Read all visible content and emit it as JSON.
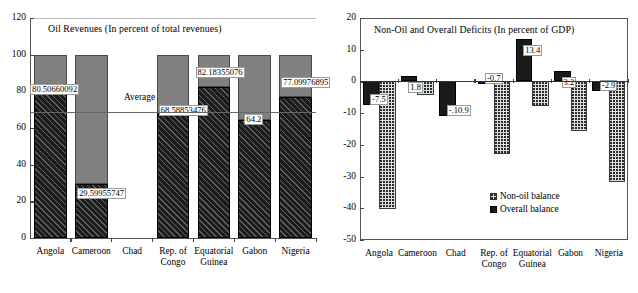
{
  "chart_data": [
    {
      "id": "oil-revenues",
      "type": "bar",
      "title": "Oil Revenues (In percent of total revenues)",
      "xlabel": "",
      "ylabel": "",
      "ylim": [
        0,
        120
      ],
      "yticks": [
        0,
        20,
        40,
        60,
        80,
        100,
        120
      ],
      "ytick_labels": [
        "0",
        "20",
        "40",
        "60",
        "80",
        "100",
        "120"
      ],
      "grid": false,
      "stacked": true,
      "categories": [
        "Angola",
        "Cameroon",
        "Chad",
        "Rep. of\nCongo",
        "Equatorial\nGuinea",
        "Gabon",
        "Nigeria"
      ],
      "category_lines": [
        [
          "Angola"
        ],
        [
          "Cameroon"
        ],
        [
          "Chad"
        ],
        [
          "Rep. of",
          "Congo"
        ],
        [
          "Equatorial",
          "Guinea"
        ],
        [
          "Gabon"
        ],
        [
          "Nigeria"
        ]
      ],
      "series": [
        {
          "name": "Oil revenues",
          "pattern": "black-hatched",
          "values": [
            80.50660092,
            29.59955747,
            null,
            68.58853476,
            82.18355076,
            64.2,
            77.09976895
          ],
          "labels": [
            "80.50660092",
            "29.59955747",
            "",
            "68.58853476",
            "82.18355076",
            "64.2",
            "77.09976895"
          ]
        },
        {
          "name": "Remainder to 100",
          "pattern": "gray",
          "values": [
            19.49339908,
            70.40044253,
            null,
            31.41146524,
            17.81644924,
            35.8,
            22.90023105
          ],
          "labels": [
            "",
            "",
            "",
            "",
            "",
            "",
            ""
          ]
        }
      ],
      "annotations": [
        {
          "name": "average-line",
          "label": "Average",
          "value": 68.6
        }
      ]
    },
    {
      "id": "non-oil-overall-deficits",
      "type": "bar",
      "title": "Non-Oil and Overall Deficits (In percent of GDP)",
      "xlabel": "",
      "ylabel": "",
      "ylim": [
        -50,
        20
      ],
      "yticks": [
        20,
        10,
        0,
        -10,
        -20,
        -30,
        -40,
        -50
      ],
      "ytick_labels": [
        "20",
        "10",
        "0",
        "-10",
        "-20",
        "-30",
        "-40",
        "-50"
      ],
      "grid": false,
      "categories": [
        "Angola",
        "Cameroon",
        "Chad",
        "Rep. of\nCongo",
        "Equatorial\nGuinea",
        "Gabon",
        "Nigeria"
      ],
      "category_lines": [
        [
          "Angola"
        ],
        [
          "Cameroon"
        ],
        [
          "Chad"
        ],
        [
          "Rep. of",
          "Congo"
        ],
        [
          "Equatorial",
          "Guinea"
        ],
        [
          "Gabon"
        ],
        [
          "Nigeria"
        ]
      ],
      "legend_position": "inside-bottom-right",
      "series": [
        {
          "name": "Overall balance",
          "pattern": "solid-black",
          "values": [
            -7.5,
            1.8,
            -10.9,
            -0.7,
            13.4,
            3.2,
            -2.9
          ],
          "labels": [
            "-7.5",
            "1.8",
            "-.10.9",
            "-0.7",
            "13.4",
            "3.2",
            "-2.9"
          ]
        },
        {
          "name": "Non-oil balance",
          "pattern": "dotted",
          "values": [
            -40.2,
            -4.3,
            0,
            -22.8,
            -7.6,
            -15.7,
            -31.8
          ],
          "labels": [
            "",
            "",
            "",
            "",
            "",
            "",
            ""
          ]
        }
      ]
    }
  ],
  "left_chart": {
    "title": "Oil Revenues (In percent of total revenues)",
    "yticks": [
      "120",
      "100",
      "80",
      "60",
      "40",
      "20",
      "0"
    ],
    "average_label": "Average",
    "bar_labels": [
      "80.50660092",
      "29.59955747",
      "68.58853476",
      "82.18355076",
      "64.2",
      "77.09976895"
    ],
    "categories": [
      {
        "l1": "Angola",
        "l2": ""
      },
      {
        "l1": "Cameroon",
        "l2": ""
      },
      {
        "l1": "Chad",
        "l2": ""
      },
      {
        "l1": "Rep. of",
        "l2": "Congo"
      },
      {
        "l1": "Equatorial",
        "l2": "Guinea"
      },
      {
        "l1": "Gabon",
        "l2": ""
      },
      {
        "l1": "Nigeria",
        "l2": ""
      }
    ]
  },
  "right_chart": {
    "title": "Non-Oil and Overall Deficits (In percent of GDP)",
    "yticks": [
      "20",
      "10",
      "0",
      "-10",
      "-20",
      "-30",
      "-40",
      "-50"
    ],
    "bar_labels": [
      "-7.5",
      "1.8",
      "-.10.9",
      "-0.7",
      "13.4",
      "3.2",
      "-2.9"
    ],
    "legend": [
      {
        "label": "Non-oil balance",
        "swatch": "dotted"
      },
      {
        "label": "Overall balance",
        "swatch": "solid"
      }
    ],
    "categories": [
      {
        "l1": "Angola",
        "l2": ""
      },
      {
        "l1": "Cameroon",
        "l2": ""
      },
      {
        "l1": "Chad",
        "l2": ""
      },
      {
        "l1": "Rep. of",
        "l2": "Congo"
      },
      {
        "l1": "Equatorial",
        "l2": "Guinea"
      },
      {
        "l1": "Gabon",
        "l2": ""
      },
      {
        "l1": "Nigeria",
        "l2": ""
      }
    ]
  },
  "colors": {
    "gray_fill": "#808080",
    "black_fill": "#1a1a1a",
    "dot_fill": "#dedede",
    "axis": "#555555"
  }
}
